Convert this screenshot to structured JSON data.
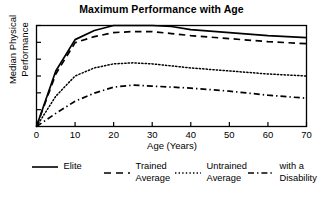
{
  "chart_data": {
    "type": "line",
    "title": "Maximum Performance with Age",
    "xlabel": "Age (Years)",
    "ylabel": "Median Physical\nPerformance",
    "xlim": [
      0,
      70
    ],
    "ylim": [
      0,
      1
    ],
    "xticks": [
      "0",
      "10",
      "20",
      "30",
      "40",
      "50",
      "60",
      "70"
    ],
    "xtick_values": [
      0,
      10,
      20,
      30,
      40,
      50,
      60,
      70
    ],
    "yticks_labeled": false,
    "ytick_count": 6,
    "grid": false,
    "legend_position": "below",
    "box_frame": true,
    "series": [
      {
        "name": "Elite",
        "legend_label_line1": "Elite",
        "legend_label_line2": "",
        "style": "solid",
        "color": "#000000",
        "x": [
          0,
          5,
          10,
          15,
          20,
          25,
          30,
          35,
          40,
          50,
          60,
          70
        ],
        "y": [
          0.0,
          0.55,
          0.86,
          0.95,
          1.0,
          1.0,
          1.0,
          0.99,
          0.96,
          0.93,
          0.9,
          0.88
        ]
      },
      {
        "name": "Trained Average",
        "legend_label_line1": "Trained",
        "legend_label_line2": "Average",
        "style": "dashed",
        "color": "#000000",
        "x": [
          0,
          5,
          10,
          15,
          20,
          25,
          30,
          35,
          40,
          50,
          60,
          70
        ],
        "y": [
          0.0,
          0.52,
          0.83,
          0.89,
          0.93,
          0.94,
          0.94,
          0.92,
          0.9,
          0.87,
          0.84,
          0.82
        ]
      },
      {
        "name": "Untrained Average",
        "legend_label_line1": "Untrained",
        "legend_label_line2": "Average",
        "style": "dotted",
        "color": "#000000",
        "x": [
          0,
          5,
          10,
          15,
          20,
          25,
          30,
          35,
          40,
          50,
          60,
          70
        ],
        "y": [
          0.0,
          0.3,
          0.5,
          0.58,
          0.62,
          0.63,
          0.62,
          0.6,
          0.58,
          0.55,
          0.52,
          0.5
        ]
      },
      {
        "name": "with a Disability",
        "legend_label_line1": "with a",
        "legend_label_line2": "Disability",
        "style": "dashdot",
        "color": "#000000",
        "x": [
          0,
          5,
          10,
          15,
          20,
          25,
          30,
          35,
          40,
          50,
          60,
          70
        ],
        "y": [
          0.0,
          0.13,
          0.25,
          0.33,
          0.39,
          0.41,
          0.4,
          0.39,
          0.38,
          0.35,
          0.31,
          0.28
        ]
      }
    ]
  }
}
